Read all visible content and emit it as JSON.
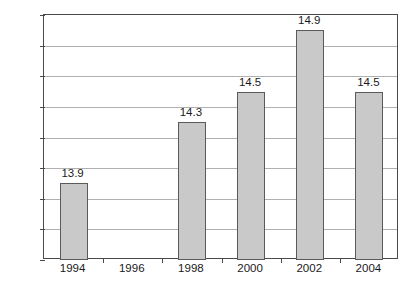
{
  "chart_data": {
    "type": "bar",
    "title": "",
    "subtitle": "",
    "xlabel": "",
    "ylabel": "",
    "categories": [
      "1994",
      "1996",
      "1998",
      "2000",
      "2002",
      "2004"
    ],
    "values": [
      13.9,
      null,
      14.3,
      14.5,
      14.9,
      14.5
    ],
    "point_labels": [
      "13.9",
      "",
      "14.3",
      "14.5",
      "14.9",
      "14.5"
    ],
    "ylim": [
      13.4,
      15.0
    ],
    "ytick_step": 0.2,
    "ytick_labels": [
      "15.0",
      "14.8",
      "14.6",
      "14.4",
      "14.2",
      "14.0",
      "13.8",
      "13.6",
      "13.4"
    ],
    "ytick_values": [
      15.0,
      14.8,
      14.6,
      14.4,
      14.2,
      14.0,
      13.8,
      13.6,
      13.4
    ],
    "grid": true,
    "legend": false,
    "legend_position": "none",
    "colors": {
      "bar_fill": "#c9c9c9",
      "bar_border": "#5a5a5a",
      "gridline": "#b0b0b0",
      "axis": "#4a4a4a",
      "text": "#1a1a1a",
      "background": "#ffffff"
    }
  }
}
